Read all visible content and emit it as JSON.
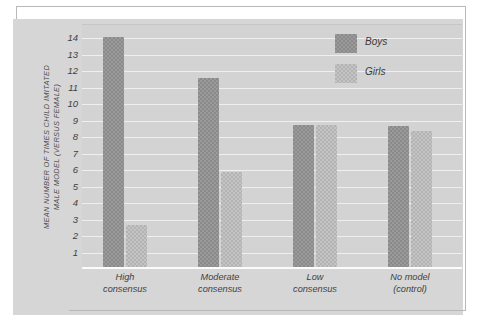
{
  "chart_data": {
    "type": "bar",
    "title": "",
    "subtitle": "",
    "xlabel": "",
    "ylabel": "MEAN NUMBER OF TIMES CHILD IMITATED\nMALE MODEL (VERSUS FEMALE)",
    "categories": [
      "High\nconsensus",
      "Moderate\nconsensus",
      "Low\nconsensus",
      "No model\n(control)"
    ],
    "series": [
      {
        "name": "Boys",
        "values": [
          14.0,
          11.5,
          8.7,
          8.6
        ],
        "color": "#9a9a9a"
      },
      {
        "name": "Girls",
        "values": [
          2.6,
          5.8,
          8.7,
          8.3
        ],
        "color": "#c4c4c4"
      }
    ],
    "ylim": [
      0,
      14.8
    ],
    "ytick_labels": [
      "14",
      "13",
      "12",
      "11",
      "10",
      "9",
      "8",
      "7",
      "6",
      "5",
      "4",
      "3",
      "2",
      "1"
    ],
    "ytick_values": [
      14,
      13,
      12,
      11,
      10,
      9,
      8,
      7,
      6,
      5,
      4,
      3,
      2,
      1
    ],
    "grid": true,
    "grid_color": "#efefef",
    "legend_position": "top-right",
    "plot_background": "#d3d3d3",
    "figure_background": "#d6d6d6"
  },
  "legend": {
    "entries": [
      {
        "label": "Boys"
      },
      {
        "label": "Girls"
      }
    ]
  }
}
